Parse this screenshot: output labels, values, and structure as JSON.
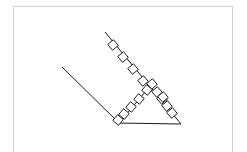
{
  "canvas": {
    "width": 247,
    "height": 152,
    "background_color": "#ffffff",
    "title": "geometry-line-figure"
  },
  "frame": {
    "name": "figure-frame",
    "border_color": "#d2d2d2",
    "fill_color": "#ffffff",
    "x": 13,
    "y": 6,
    "width": 220,
    "height": 160
  },
  "figure": {
    "stroke_color": "#1a1a1a",
    "stroke_width": 1,
    "lines": [
      {
        "name": "upper-ray",
        "x1": 105,
        "y1": 32,
        "x2": 181,
        "y2": 124
      },
      {
        "name": "lower-left-ray",
        "x1": 62,
        "y1": 67,
        "x2": 119,
        "y2": 123
      },
      {
        "name": "base-line",
        "x1": 117,
        "y1": 123,
        "x2": 181,
        "y2": 124
      },
      {
        "name": "interior-line",
        "x1": 119,
        "y1": 123,
        "x2": 152,
        "y2": 84
      }
    ],
    "square_chains": [
      {
        "name": "upper-ray-squares",
        "count": 5,
        "size": 7.5,
        "points": [
          {
            "x": 113,
            "y": 45,
            "rot": 50
          },
          {
            "x": 123,
            "y": 57,
            "rot": 50
          },
          {
            "x": 133,
            "y": 69,
            "rot": 50
          },
          {
            "x": 143,
            "y": 81,
            "rot": 50
          },
          {
            "x": 152,
            "y": 84,
            "rot": 50
          }
        ]
      },
      {
        "name": "interior-line-squares",
        "count": 5,
        "size": 7.5,
        "points": [
          {
            "x": 147,
            "y": 90,
            "rot": 40
          },
          {
            "x": 139,
            "y": 99,
            "rot": 40
          },
          {
            "x": 131,
            "y": 107,
            "rot": 40
          },
          {
            "x": 124,
            "y": 114,
            "rot": 40
          },
          {
            "x": 118,
            "y": 120,
            "rot": 40
          }
        ]
      },
      {
        "name": "hypotenuse-squares",
        "count": 5,
        "size": 7.5,
        "points": [
          {
            "x": 157,
            "y": 92,
            "rot": 50
          },
          {
            "x": 162,
            "y": 99,
            "rot": 50
          },
          {
            "x": 167,
            "y": 106,
            "rot": 50
          },
          {
            "x": 172,
            "y": 113,
            "rot": 50
          },
          {
            "x": 163,
            "y": 97,
            "rot": 50
          }
        ]
      }
    ]
  }
}
